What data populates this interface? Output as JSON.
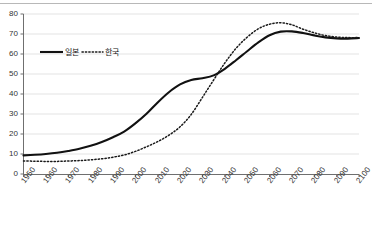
{
  "chart_data": {
    "type": "line",
    "title": "",
    "xlabel": "",
    "ylabel": "",
    "xlim": [
      1950,
      2100
    ],
    "ylim": [
      0,
      80
    ],
    "ytick_step": 10,
    "xtick_step": 10,
    "grid": true,
    "grid_axis": "y",
    "legend_position": "upper-left-inside",
    "xticks": [
      "1950",
      "1960",
      "1970",
      "1980",
      "1990",
      "2000",
      "2010",
      "2020",
      "2030",
      "2040",
      "2050",
      "2060",
      "2070",
      "2080",
      "2090",
      "2100"
    ],
    "yticks": [
      "0",
      "10",
      "20",
      "30",
      "40",
      "50",
      "60",
      "70",
      "80"
    ],
    "x": [
      1950,
      1955,
      1960,
      1965,
      1970,
      1975,
      1980,
      1985,
      1990,
      1995,
      2000,
      2005,
      2010,
      2015,
      2020,
      2025,
      2030,
      2035,
      2040,
      2045,
      2050,
      2055,
      2060,
      2065,
      2070,
      2075,
      2080,
      2085,
      2090,
      2095,
      2100
    ],
    "series": [
      {
        "name": "일본",
        "style": "solid",
        "color": "#111111",
        "values": [
          9.3,
          9.6,
          10.0,
          10.6,
          11.5,
          12.6,
          14.1,
          16.0,
          18.4,
          21.2,
          25.3,
          30.1,
          35.8,
          40.9,
          44.8,
          47.0,
          47.9,
          49.3,
          52.6,
          56.9,
          61.4,
          65.8,
          69.4,
          71.2,
          71.3,
          70.5,
          69.3,
          68.3,
          67.8,
          67.7,
          68.0
        ]
      },
      {
        "name": "한국",
        "style": "dotted",
        "color": "#1a1a1a",
        "values": [
          6.5,
          6.4,
          6.3,
          6.3,
          6.5,
          6.7,
          7.1,
          7.6,
          8.4,
          9.5,
          11.3,
          13.6,
          16.2,
          19.4,
          23.6,
          29.8,
          38.3,
          47.0,
          55.5,
          62.8,
          68.4,
          72.6,
          74.9,
          75.6,
          74.6,
          72.4,
          70.6,
          69.2,
          68.5,
          68.2,
          68.2
        ]
      }
    ],
    "legend": [
      {
        "label": "일본",
        "style": "solid"
      },
      {
        "label": "한국",
        "style": "dotted"
      }
    ]
  }
}
